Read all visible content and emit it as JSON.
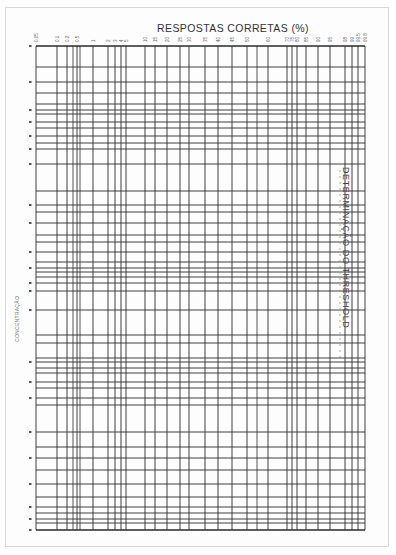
{
  "document": {
    "title": "RESPOSTAS CORRETAS (%)",
    "y_axis_label": "CONCENTRAÇÃO",
    "side_title": "DETERMINAÇÃO DO THRESHOLD"
  },
  "colors": {
    "grid": "#2a2a2a",
    "paper": "#fdfdfd",
    "text": "#333333"
  },
  "grid": {
    "left": 36,
    "right": 365,
    "top": 46,
    "bottom": 530,
    "x_ticks": [
      {
        "label": "0.05",
        "x": 36
      },
      {
        "label": "0.1",
        "x": 57
      },
      {
        "label": "0.2",
        "x": 67
      },
      {
        "label": "0.5",
        "x": 77
      },
      {
        "label": "1",
        "x": 93
      },
      {
        "label": "2",
        "x": 108
      },
      {
        "label": "3",
        "x": 115
      },
      {
        "label": "4",
        "x": 121
      },
      {
        "label": "5",
        "x": 126
      },
      {
        "label": "10",
        "x": 145
      },
      {
        "label": "15",
        "x": 155
      },
      {
        "label": "20",
        "x": 167
      },
      {
        "label": "25",
        "x": 180
      },
      {
        "label": "30",
        "x": 189
      },
      {
        "label": "35",
        "x": 205
      },
      {
        "label": "40",
        "x": 218
      },
      {
        "label": "45",
        "x": 232
      },
      {
        "label": "50",
        "x": 247
      },
      {
        "label": "60",
        "x": 268
      },
      {
        "label": "70",
        "x": 287
      },
      {
        "label": "75",
        "x": 292
      },
      {
        "label": "80",
        "x": 297
      },
      {
        "label": "85",
        "x": 306
      },
      {
        "label": "90",
        "x": 318
      },
      {
        "label": "95",
        "x": 330
      },
      {
        "label": "98",
        "x": 345
      },
      {
        "label": "99",
        "x": 352
      },
      {
        "label": "99.5",
        "x": 358
      },
      {
        "label": "99.8",
        "x": 365
      }
    ],
    "x_extra_lines": [
      73,
      80,
      257
    ],
    "y_lines": [
      46,
      67,
      82,
      93,
      104,
      110,
      114,
      122,
      128,
      136,
      143,
      149,
      164,
      191,
      205,
      212,
      223,
      235,
      242,
      252,
      262,
      268,
      272,
      277,
      283,
      291,
      310,
      335,
      343,
      358,
      362,
      368,
      373,
      382,
      388,
      398,
      405,
      432,
      447,
      458,
      470,
      484,
      497,
      507,
      513,
      519,
      523,
      530
    ],
    "y_tick_marks": [
      46,
      82,
      110,
      122,
      136,
      149,
      164,
      205,
      223,
      252,
      268,
      283,
      291,
      310,
      362,
      382,
      398,
      432,
      458,
      484,
      507,
      519,
      530
    ]
  }
}
